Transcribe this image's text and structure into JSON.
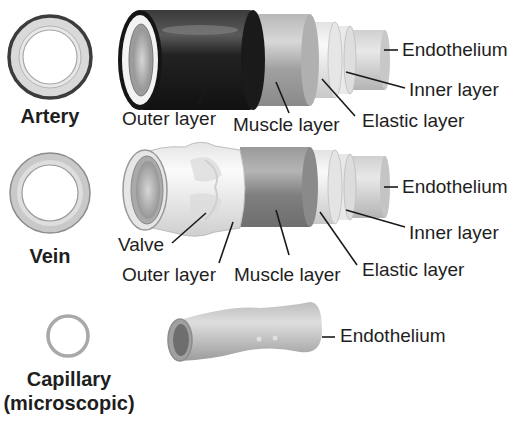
{
  "diagram": {
    "type": "labeled-illustration"
  },
  "vessels": [
    {
      "name": "Artery",
      "labels": {
        "endothelium": "Endothelium",
        "inner_layer": "Inner layer",
        "outer_layer": "Outer layer",
        "muscle_layer": "Muscle layer",
        "elastic_layer": "Elastic layer"
      }
    },
    {
      "name": "Vein",
      "labels": {
        "endothelium": "Endothelium",
        "inner_layer": "Inner layer",
        "valve": "Valve",
        "outer_layer": "Outer layer",
        "muscle_layer": "Muscle layer",
        "elastic_layer": "Elastic layer"
      }
    },
    {
      "name": "Capillary",
      "subtitle": "(microscopic)",
      "labels": {
        "endothelium": "Endothelium"
      }
    }
  ],
  "colors": {
    "artery_outer": "#1c1c1c",
    "muscle": "#9a9a9a",
    "elastic": "#dcdcdc",
    "endothelium": "#c4c4c4",
    "vein_outer": "#ececec",
    "capillary": "#b0b0b0",
    "text": "#1e1e1e"
  }
}
